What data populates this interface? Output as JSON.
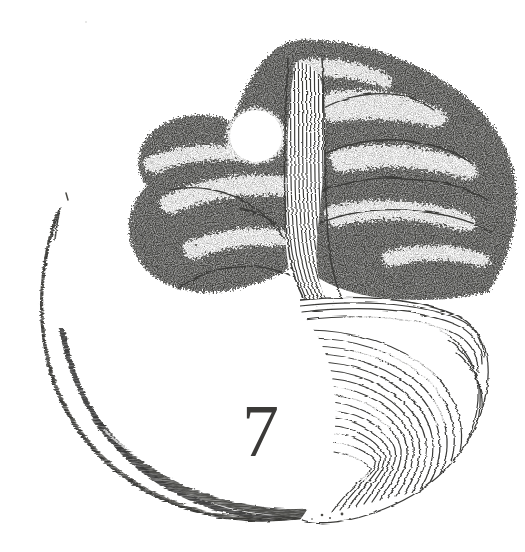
{
  "page": {
    "kind": "chapter-opener-illustration",
    "background_color": "#ffffff",
    "ink_color": "#3a3a38",
    "width": 525,
    "height": 552
  },
  "chapter": {
    "number": "7"
  },
  "artwork": {
    "title": "Enso circle formed by a gnarled tree",
    "style": "pen-and-ink engraving",
    "elements": [
      {
        "name": "enso-arc",
        "label": "brush arc"
      },
      {
        "name": "tree-canopy",
        "label": "stippled foliage canopy"
      },
      {
        "name": "moon-gap",
        "label": "white circular gap in canopy"
      },
      {
        "name": "tree-trunk",
        "label": "striated curving trunk"
      },
      {
        "name": "tree-roots",
        "label": "sweeping root mass"
      },
      {
        "name": "ink-specks",
        "label": "scattered ink specks"
      }
    ]
  }
}
